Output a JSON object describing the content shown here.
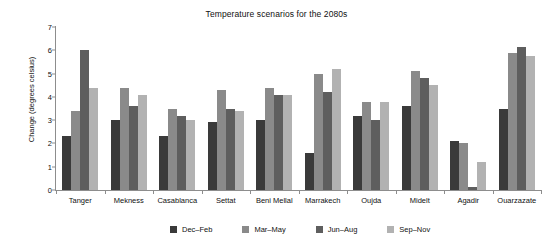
{
  "chart_data": {
    "type": "bar",
    "title": "Temperature scenarios for the 2080s",
    "xlabel": "",
    "ylabel": "Change (degrees celsius)",
    "ylim": [
      0,
      7
    ],
    "yticks": [
      0,
      1,
      2,
      3,
      4,
      5,
      6,
      7
    ],
    "grid": false,
    "legend_position": "bottom",
    "categories": [
      "Tanger",
      "Mekness",
      "Casablanca",
      "Settat",
      "Beni Mellal",
      "Marrakech",
      "Oujda",
      "Midelt",
      "Agadir",
      "Ouarzazate"
    ],
    "series": [
      {
        "name": "Dec–Feb",
        "color": "#3a3a3a",
        "values": [
          2.3,
          3.0,
          2.3,
          2.9,
          3.0,
          1.6,
          3.2,
          3.6,
          2.1,
          3.5
        ]
      },
      {
        "name": "Mar–May",
        "color": "#8a8a8a",
        "values": [
          3.4,
          4.4,
          3.5,
          4.3,
          4.4,
          5.0,
          3.8,
          5.1,
          2.0,
          5.9
        ]
      },
      {
        "name": "Jun–Aug",
        "color": "#5e5e5e",
        "values": [
          6.0,
          3.6,
          3.2,
          3.5,
          4.1,
          4.2,
          3.0,
          4.8,
          0.15,
          6.15
        ]
      },
      {
        "name": "Sep–Nov",
        "color": "#b2b2b2",
        "values": [
          4.4,
          4.1,
          3.0,
          3.4,
          4.1,
          5.2,
          3.8,
          4.5,
          1.2,
          5.75
        ]
      }
    ]
  }
}
